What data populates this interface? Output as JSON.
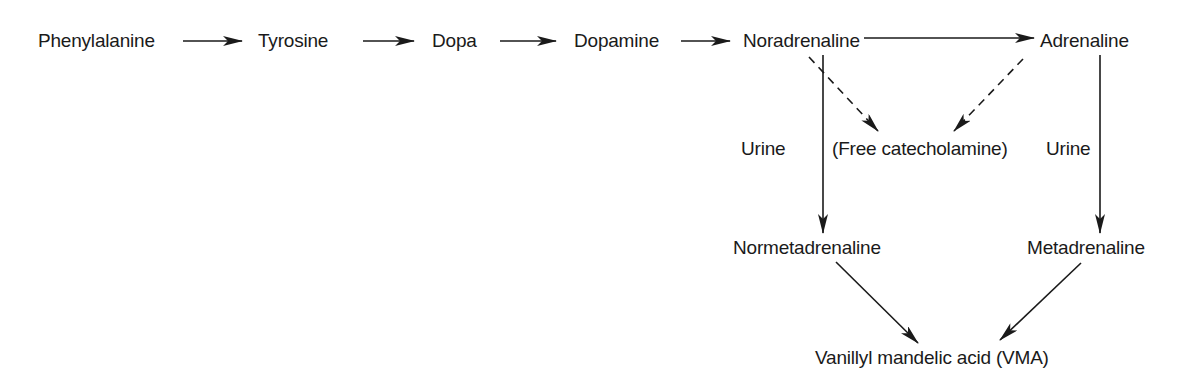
{
  "diagram": {
    "type": "metabolic-pathway",
    "nodes": {
      "phenylalanine": "Phenylalanine",
      "tyrosine": "Tyrosine",
      "dopa": "Dopa",
      "dopamine": "Dopamine",
      "noradrenaline": "Noradrenaline",
      "adrenaline": "Adrenaline",
      "free_catecholamine": "(Free catecholamine)",
      "normetadrenaline": "Normetadrenaline",
      "metadrenaline": "Metadrenaline",
      "vma": "Vanillyl mandelic acid (VMA)"
    },
    "edge_labels": {
      "urine_left": "Urine",
      "urine_right": "Urine"
    },
    "edges": [
      {
        "from": "Phenylalanine",
        "to": "Tyrosine",
        "style": "solid"
      },
      {
        "from": "Tyrosine",
        "to": "Dopa",
        "style": "solid"
      },
      {
        "from": "Dopa",
        "to": "Dopamine",
        "style": "solid"
      },
      {
        "from": "Dopamine",
        "to": "Noradrenaline",
        "style": "solid"
      },
      {
        "from": "Noradrenaline",
        "to": "Adrenaline",
        "style": "solid"
      },
      {
        "from": "Noradrenaline",
        "to": "(Free catecholamine)",
        "style": "dashed"
      },
      {
        "from": "Adrenaline",
        "to": "(Free catecholamine)",
        "style": "dashed"
      },
      {
        "from": "Noradrenaline",
        "to": "Normetadrenaline",
        "style": "solid",
        "label": "Urine"
      },
      {
        "from": "Adrenaline",
        "to": "Metadrenaline",
        "style": "solid",
        "label": "Urine"
      },
      {
        "from": "Normetadrenaline",
        "to": "Vanillyl mandelic acid (VMA)",
        "style": "solid"
      },
      {
        "from": "Metadrenaline",
        "to": "Vanillyl mandelic acid (VMA)",
        "style": "solid"
      }
    ],
    "colors": {
      "ink": "#1a1a1a",
      "background": "#ffffff"
    }
  }
}
